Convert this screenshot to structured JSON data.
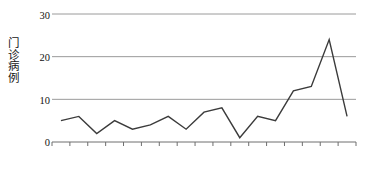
{
  "chart_data": {
    "type": "line",
    "title": "",
    "xlabel": "",
    "ylabel": "门诊病例",
    "ylabel_chars": [
      "门",
      "诊",
      "病",
      "例"
    ],
    "categories": [
      "10-21",
      "10-22",
      "10-23",
      "10-24",
      "10-25",
      "10-26",
      "10-27",
      "10-28",
      "10-29",
      "10-30",
      "10-31",
      "11-1",
      "11-2",
      "11-3",
      "11-4",
      "11-5",
      "11-6"
    ],
    "values": [
      5,
      6,
      2,
      5,
      3,
      4,
      6,
      3,
      7,
      8,
      1,
      6,
      5,
      12,
      13,
      24,
      6
    ],
    "series": [
      {
        "name": "门诊病例",
        "values": [
          5,
          6,
          2,
          5,
          3,
          4,
          6,
          3,
          7,
          8,
          1,
          6,
          5,
          12,
          13,
          24,
          6
        ]
      }
    ],
    "ylim": [
      0,
      30
    ],
    "yticks": [
      0,
      10,
      20,
      30
    ],
    "ytick_labels": [
      "0",
      "10",
      "20",
      "30"
    ],
    "grid": true,
    "grid_axis": "y",
    "legend": "none",
    "markers": false,
    "line_color": "#3b3b3b",
    "grid_color": "#9a9a9a",
    "axis_color": "#6e6e6e",
    "background": "#ffffff"
  }
}
